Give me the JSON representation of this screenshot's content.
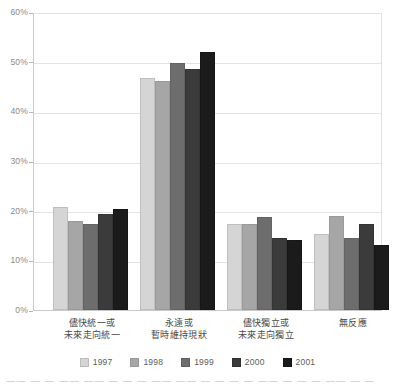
{
  "chart_data": {
    "type": "bar",
    "title": "",
    "xlabel": "",
    "ylabel": "",
    "ylim": [
      0,
      60
    ],
    "ytick_labels": [
      "60%",
      "50%",
      "40%",
      "30%",
      "20%",
      "10%",
      "0%"
    ],
    "ytick_values": [
      60,
      50,
      40,
      30,
      20,
      10,
      0
    ],
    "grid": true,
    "legend_position": "bottom",
    "categories": [
      "儘快統一或\n未來走向統一",
      "永遠或\n暫時維持現狀",
      "儘快獨立或\n未來走向獨立",
      "無反應"
    ],
    "categories_lines": [
      [
        "儘快統一或",
        "未來走向統一"
      ],
      [
        "永遠或",
        "暫時維持現狀"
      ],
      [
        "儘快獨立或",
        "未來走向獨立"
      ],
      [
        "無反應",
        ""
      ]
    ],
    "series": [
      {
        "name": "1997",
        "color": "#d5d5d5",
        "values": [
          20.8,
          46.8,
          17.3,
          15.4
        ]
      },
      {
        "name": "1998",
        "color": "#a6a6a6",
        "values": [
          18.0,
          46.2,
          17.3,
          18.9
        ]
      },
      {
        "name": "1999",
        "color": "#6d6d6d",
        "values": [
          17.3,
          49.8,
          18.7,
          14.4
        ]
      },
      {
        "name": "2000",
        "color": "#3b3b3b",
        "values": [
          19.3,
          48.6,
          14.5,
          17.3
        ]
      },
      {
        "name": "2001",
        "color": "#1b1b1b",
        "values": [
          20.3,
          52.0,
          14.0,
          13.1
        ]
      }
    ]
  },
  "legend": {
    "items": [
      {
        "label": "1997"
      },
      {
        "label": "1998"
      },
      {
        "label": "1999"
      },
      {
        "label": "2000"
      },
      {
        "label": "2001"
      }
    ]
  },
  "caption": {
    "text": "—— —  —  ——     ——  —  —  —  ——  ——  —  —  —   —  ——  —  —  —  ——  —  —"
  }
}
